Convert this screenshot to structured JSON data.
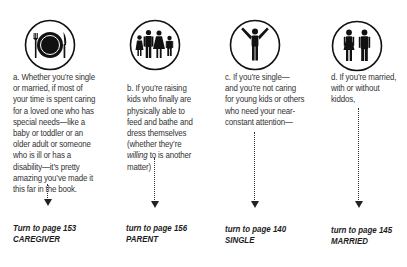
{
  "options": [
    {
      "icon": "dinner-plate-icon",
      "text_before": "a. Whether you’re single\nor married, if most of\nyour time is spent caring\nfor a loved one who has\nspecial needs—like a\nbaby or toddler or an\nolder adult or someone\nwho is ill or has a\ndisability—it’s pretty\namazing you’ve made it\nthis far in the book.",
      "turn_to": "Turn to page 153",
      "category": "CAREGIVER"
    },
    {
      "icon": "family-icon",
      "text_before": "b. If you’re raising\nkids who finally are\nphysically able to\nfeed and bathe and\ndress themselves\n(whether they’re",
      "text_em": "willing",
      "text_after": " to is another\nmatter)",
      "turn_to": "turn to page 156",
      "category": "PARENT"
    },
    {
      "icon": "single-person-icon",
      "text_before": "c. If you’re single—\nand you’re not caring\nfor young kids or others\nwho need your near-\nconstant attention—",
      "turn_to": "turn to page 140",
      "category": "SINGLE"
    },
    {
      "icon": "couple-icon",
      "text_before": "d. If you’re married,\nwith or without\nkiddos,",
      "turn_to": "turn to page 145",
      "category": "MARRIED"
    }
  ]
}
